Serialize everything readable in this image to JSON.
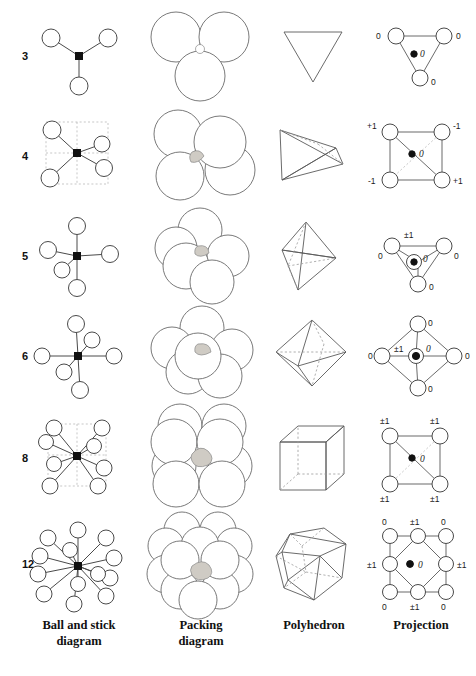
{
  "figure": {
    "kind": "crystallography-coordination-table"
  },
  "columns": [
    {
      "id": "ball-and-stick",
      "line1": "Ball and stick",
      "line2": "diagram"
    },
    {
      "id": "packing",
      "line1": "Packing",
      "line2": "diagram"
    },
    {
      "id": "polyhedron",
      "line1": "Polyhedron",
      "line2": ""
    },
    {
      "id": "projection",
      "line1": "Projection",
      "line2": ""
    }
  ],
  "rows": [
    {
      "coordination_number": "3",
      "polyhedron_name": "triangle",
      "packing_spheres": 3,
      "projection": {
        "center": "0",
        "vertices": [
          {
            "pos": "top-left",
            "label": "0"
          },
          {
            "pos": "top-right",
            "label": "0"
          },
          {
            "pos": "bottom",
            "label": "0"
          }
        ]
      }
    },
    {
      "coordination_number": "4",
      "polyhedron_name": "tetrahedron",
      "packing_spheres": 4,
      "projection": {
        "center": "0",
        "vertices": [
          {
            "pos": "top-left",
            "label": "+1"
          },
          {
            "pos": "top-right",
            "label": "-1"
          },
          {
            "pos": "bottom-left",
            "label": "-1"
          },
          {
            "pos": "bottom-right",
            "label": "+1"
          }
        ]
      }
    },
    {
      "coordination_number": "5",
      "polyhedron_name": "trigonal bipyramid",
      "packing_spheres": 5,
      "projection": {
        "center": "0",
        "center_extra": "±1",
        "vertices": [
          {
            "pos": "top-left",
            "label": "0"
          },
          {
            "pos": "top-right",
            "label": "0"
          },
          {
            "pos": "bottom",
            "label": "0"
          }
        ]
      }
    },
    {
      "coordination_number": "6",
      "polyhedron_name": "octahedron",
      "packing_spheres": 6,
      "projection": {
        "center": "0",
        "center_extra": "±1",
        "vertices": [
          {
            "pos": "top",
            "label": "0"
          },
          {
            "pos": "right",
            "label": "0"
          },
          {
            "pos": "bottom",
            "label": "0"
          },
          {
            "pos": "left",
            "label": "0"
          }
        ]
      }
    },
    {
      "coordination_number": "8",
      "polyhedron_name": "cube",
      "packing_spheres": 8,
      "projection": {
        "center": "0",
        "vertices": [
          {
            "pos": "top-left",
            "label": "±1"
          },
          {
            "pos": "top-right",
            "label": "±1"
          },
          {
            "pos": "bottom-left",
            "label": "±1"
          },
          {
            "pos": "bottom-right",
            "label": "±1"
          }
        ]
      }
    },
    {
      "coordination_number": "12",
      "polyhedron_name": "cuboctahedron",
      "packing_spheres": 12,
      "projection": {
        "center": "0",
        "vertices": [
          {
            "pos": "top-left",
            "label": "0"
          },
          {
            "pos": "top-center",
            "label": "±1"
          },
          {
            "pos": "top-right",
            "label": "0"
          },
          {
            "pos": "mid-left",
            "label": "±1"
          },
          {
            "pos": "mid-right",
            "label": "±1"
          },
          {
            "pos": "bottom-left",
            "label": "0"
          },
          {
            "pos": "bottom-center",
            "label": "±1"
          },
          {
            "pos": "bottom-right",
            "label": "0"
          }
        ]
      }
    }
  ],
  "colors": {
    "atom_outline": "#4a4a4a",
    "center_atom": "#111111",
    "bond": "#4a4a4a",
    "sphere_outline": "#6a6a6a",
    "interstice_fill": "#cfcbc4",
    "guide_dashed": "#b9b9b9",
    "text": "#1a1a1a",
    "background": "#ffffff"
  }
}
